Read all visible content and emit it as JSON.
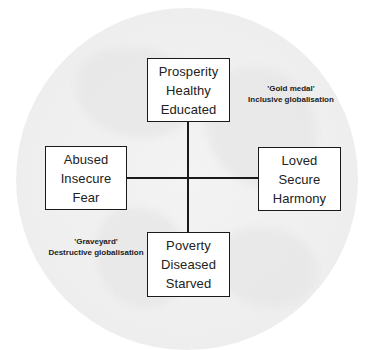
{
  "diagram": {
    "boxes": {
      "top": {
        "lines": [
          "Prosperity",
          "Healthy",
          "Educated"
        ]
      },
      "left": {
        "lines": [
          "Abused",
          "Insecure",
          "Fear"
        ]
      },
      "right": {
        "lines": [
          "Loved",
          "Secure",
          "Harmony"
        ]
      },
      "bottom": {
        "lines": [
          "Poverty",
          "Diseased",
          "Starved"
        ]
      }
    },
    "annotations": {
      "gold": {
        "title": "'Gold medal'",
        "subtitle": "Inclusive globalisation"
      },
      "graveyard": {
        "title": "'Graveyard'",
        "subtitle": "Destructive globalisation"
      }
    },
    "colors": {
      "line": "#1a1a1a",
      "globe": "#efefef",
      "text": "#222222"
    }
  }
}
